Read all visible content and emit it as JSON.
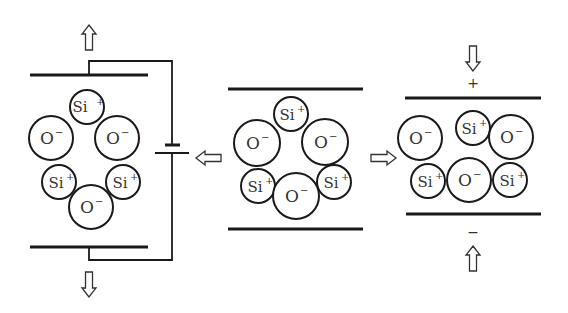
{
  "figure": {
    "colors": {
      "stroke": "#1a1a1a",
      "background": "#ffffff"
    }
  },
  "labels": {
    "si": "Si",
    "o": "O",
    "plus_sup": "+",
    "minus_sup": "−",
    "plus_sign": "+",
    "minus_sign": "−"
  },
  "panels": [
    {
      "name": "left",
      "state": "stretched-by-applied-voltage",
      "has_battery": true,
      "arrows": [
        "up",
        "down"
      ]
    },
    {
      "name": "middle",
      "state": "neutral",
      "has_battery": false,
      "arrows": []
    },
    {
      "name": "right",
      "state": "compressed",
      "top_charge": "+",
      "bottom_charge": "−",
      "arrows": [
        "down",
        "up"
      ]
    }
  ],
  "connecting_arrows": [
    "left",
    "right"
  ]
}
